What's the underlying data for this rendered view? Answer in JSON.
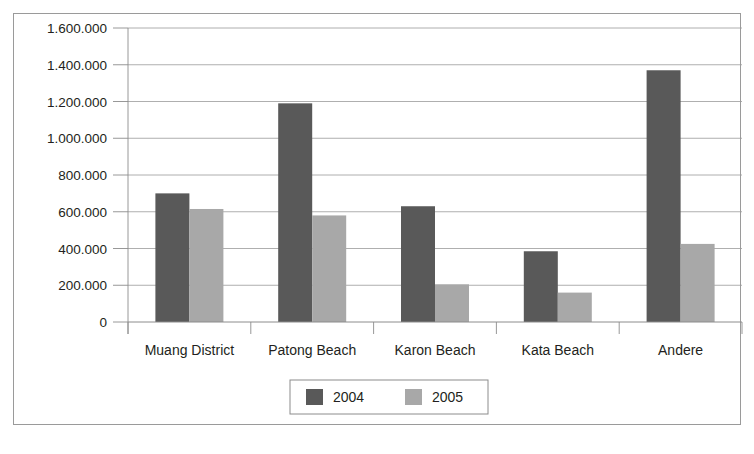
{
  "chart_data": {
    "type": "bar",
    "title": "",
    "subtitle": "",
    "xlabel": "",
    "ylabel": "",
    "categories": [
      "Muang District",
      "Patong Beach",
      "Karon Beach",
      "Kata Beach",
      "Andere"
    ],
    "series": [
      {
        "name": "2004",
        "color": "#595959",
        "values": [
          700000,
          1190000,
          630000,
          385000,
          1370000
        ]
      },
      {
        "name": "2005",
        "color": "#a8a8a8",
        "values": [
          615000,
          580000,
          205000,
          160000,
          425000
        ]
      }
    ],
    "ylim": [
      0,
      1600000
    ],
    "y_ticks": [
      0,
      200000,
      400000,
      600000,
      800000,
      1000000,
      1200000,
      1400000,
      1600000
    ],
    "y_tick_labels": [
      "0",
      "200.000",
      "400.000",
      "600.000",
      "800.000",
      "1.000.000",
      "1.200.000",
      "1.400.000",
      "1.600.000"
    ],
    "grid": true,
    "grid_axis": "y",
    "grid_color": "#9a9a9a",
    "legend_position": "bottom-center",
    "legend_entries": [
      {
        "label": "2004",
        "color": "#595959"
      },
      {
        "label": "2005",
        "color": "#a8a8a8"
      }
    ],
    "axis_color": "#8c8c8c",
    "frame_color": "#9a9a9a",
    "background": "#ffffff"
  }
}
